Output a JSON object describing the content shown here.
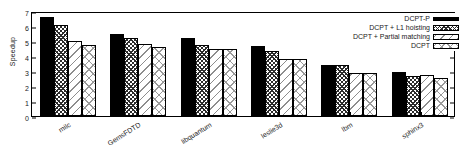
{
  "chart_data": {
    "type": "bar",
    "title": "",
    "xlabel": "",
    "ylabel": "Speedup",
    "ylim": [
      0,
      7
    ],
    "yticks": [
      0,
      1,
      2,
      3,
      4,
      5,
      6,
      7
    ],
    "grid": false,
    "legend_position": "top-right",
    "categories": [
      "milc",
      "GemsFDTD",
      "libquantum",
      "leslie3d",
      "lbm",
      "sphinx3"
    ],
    "series": [
      {
        "name": "DCPT-P",
        "pattern": "solid-black",
        "values": [
          6.6,
          5.45,
          5.2,
          4.65,
          3.42,
          2.95
        ]
      },
      {
        "name": "DCPT + L1 hoisting",
        "pattern": "dense-crosshatch",
        "values": [
          6.05,
          5.2,
          4.75,
          4.35,
          3.4,
          2.7
        ]
      },
      {
        "name": "DCPT + Partial matching",
        "pattern": "sparse-diagonal",
        "values": [
          5.0,
          4.8,
          4.45,
          3.78,
          2.85,
          2.72
        ]
      },
      {
        "name": "DCPT",
        "pattern": "light-crosshatch",
        "values": [
          4.75,
          4.6,
          4.45,
          3.78,
          2.85,
          2.55
        ]
      }
    ]
  }
}
